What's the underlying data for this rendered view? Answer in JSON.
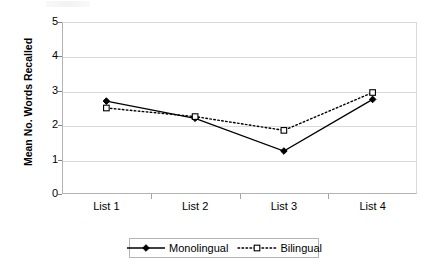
{
  "chart_data": {
    "type": "line",
    "title": "",
    "xlabel": "",
    "ylabel": "Mean No. Words Recalled",
    "categories": [
      "List 1",
      "List 2",
      "List 3",
      "List 4"
    ],
    "ylim": [
      0,
      5
    ],
    "yticks": [
      0,
      1,
      2,
      3,
      4,
      5
    ],
    "ytick_labels": [
      "0",
      "1",
      "2",
      "3",
      "4",
      "5"
    ],
    "grid": true,
    "legend_position": "bottom",
    "series": [
      {
        "name": "Monolingual",
        "values": [
          2.7,
          2.2,
          1.25,
          2.75
        ],
        "line_style": "solid",
        "marker": "filled-diamond",
        "color": "#000000"
      },
      {
        "name": "Bilingual",
        "values": [
          2.5,
          2.25,
          1.85,
          2.95
        ],
        "line_style": "dotted",
        "marker": "open-square",
        "color": "#000000"
      }
    ]
  },
  "axes": {
    "y_title": "Mean No. Words Recalled",
    "y_tick_labels": [
      "5",
      "4",
      "3",
      "2",
      "1",
      "0"
    ],
    "x_tick_labels": [
      "List 1",
      "List 2",
      "List 3",
      "List 4"
    ]
  },
  "legend": {
    "items": [
      {
        "label": "Monolingual",
        "marker": "filled-diamond-icon",
        "line": "solid"
      },
      {
        "label": "Bilingual",
        "marker": "open-square-icon",
        "line": "dotted"
      }
    ]
  }
}
